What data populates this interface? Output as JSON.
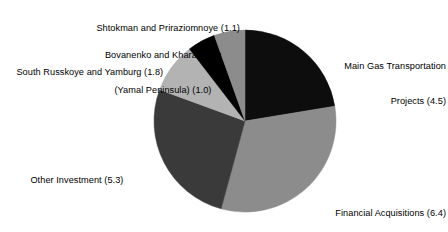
{
  "chart_data": {
    "type": "pie",
    "title": "",
    "subtitle": "",
    "xlabel": "",
    "ylabel": "",
    "units": "",
    "legend_position": "none",
    "grid": false,
    "label_format": "name (value)",
    "total": 20.1,
    "center": {
      "x": 245,
      "y": 121
    },
    "radius": 91,
    "start_angle_deg": 0,
    "direction": "clockwise",
    "categories": [
      "Main Gas Transportation Projects",
      "Financial Acquisitions",
      "Other Investment",
      "South Russkoye and Yamburg",
      "Bovanenko and Kharasavey (Yamal Peninsula)",
      "Shtokman and Priraziomnoye"
    ],
    "values": [
      4.5,
      6.4,
      5.3,
      1.8,
      1.0,
      1.1
    ],
    "colors": [
      "#0d0d0d",
      "#8c8c8c",
      "#3a3a3a",
      "#b3b3b3",
      "#000000",
      "#8c8c8c"
    ],
    "slices": [
      {
        "name": "Main Gas Transportation Projects",
        "value": 4.5,
        "color": "#0d0d0d",
        "label": "Main Gas Transportation\nProjects (4.5)",
        "label_line_1": "Main Gas Transportation",
        "label_line_2": "Projects (4.5)",
        "label_side": "right"
      },
      {
        "name": "Financial Acquisitions",
        "value": 6.4,
        "color": "#8c8c8c",
        "label": "Financial Acquisitions (6.4)",
        "label_line_1": "Financial Acquisitions (6.4)",
        "label_side": "right"
      },
      {
        "name": "Other Investment",
        "value": 5.3,
        "color": "#3a3a3a",
        "label": "Other Investment (5.3)",
        "label_line_1": "Other Investment (5.3)",
        "label_side": "left"
      },
      {
        "name": "South Russkoye and Yamburg",
        "value": 1.8,
        "color": "#b3b3b3",
        "label": "South Russkoye and Yamburg (1.8)",
        "label_line_1": "South Russkoye and Yamburg (1.8)",
        "label_side": "left"
      },
      {
        "name": "Bovanenko and Kharasavey (Yamal Peninsula)",
        "value": 1.0,
        "color": "#000000",
        "label": "Bovanenko and Kharasavey\n(Yamal Peninsula) (1.0)",
        "label_line_1": "Bovanenko and Kharasavey",
        "label_line_2": "(Yamal Peninsula) (1.0)",
        "label_side": "left"
      },
      {
        "name": "Shtokman and Priraziomnoye",
        "value": 1.1,
        "color": "#8c8c8c",
        "label": "Shtokman and Priraziomnoye (1.1)",
        "label_line_1": "Shtokman and Priraziomnoye (1.1)",
        "label_side": "left"
      }
    ]
  },
  "labels": {
    "maingas_line1": "Main Gas Transportation",
    "maingas_line2": "Projects (4.5)",
    "financial": "Financial Acquisitions (6.4)",
    "other": "Other Investment (5.3)",
    "south": "South Russkoye and Yamburg (1.8)",
    "bovanenko_line1": "Bovanenko and Kharasavey",
    "bovanenko_line2": "(Yamal Peninsula) (1.0)",
    "shtokman": "Shtokman and Priraziomnoye (1.1)"
  },
  "background": "#ffffff",
  "text_color": "#000000"
}
